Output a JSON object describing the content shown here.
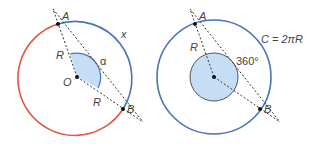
{
  "colors": {
    "arc_major": "#e0563f",
    "arc_minor": "#4a74b8",
    "circle": "#4a74b8",
    "sector_fill": "#c5def5",
    "sector_stroke": "#4a74b8",
    "line": "#333333"
  },
  "left_figure": {
    "point_a": "A",
    "point_b": "B",
    "center": "O",
    "radius_label_1": "R",
    "radius_label_2": "R",
    "arc_label": "x",
    "angle_label": "α"
  },
  "right_figure": {
    "point_a": "A",
    "point_b": "B",
    "radius_label": "R",
    "circumference_label": "C = 2πR",
    "angle_label": "360°"
  }
}
